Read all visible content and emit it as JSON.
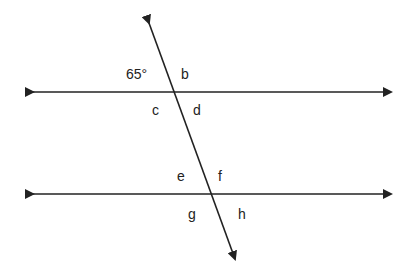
{
  "diagram": {
    "type": "parallel lines cut by a transversal",
    "colors": {
      "line": "#222222",
      "background": "#ffffff",
      "text": "#222222"
    },
    "lines": {
      "top_parallel": {
        "x1": 25,
        "y1": 92,
        "x2": 399,
        "y2": 92
      },
      "bottom_parallel": {
        "x1": 25,
        "y1": 194,
        "x2": 399,
        "y2": 194
      },
      "transversal": {
        "x1": 146,
        "y1": 16,
        "x2": 237,
        "y2": 266
      }
    },
    "labels": {
      "given_angle": "65°",
      "b": "b",
      "c": "c",
      "d": "d",
      "e": "e",
      "f": "f",
      "g": "g",
      "h": "h"
    }
  }
}
